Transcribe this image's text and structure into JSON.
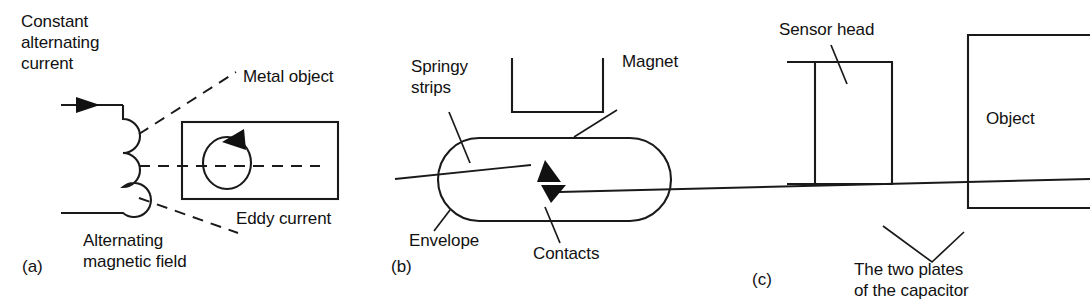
{
  "figure": {
    "background_color": "#ffffff",
    "line_color": "#1a1a1a",
    "text_color": "#111111",
    "width": 1090,
    "height": 307
  },
  "panels": [
    {
      "id": "(a)",
      "name": "eddy-current-sensor",
      "labels": {
        "source": "Constant\nalternating\ncurrent",
        "source_line1": "Constant",
        "source_line2": "alternating",
        "source_line3": "current",
        "field": "Alternating\nmagnetic field",
        "field_line1": "Alternating",
        "field_line2": "magnetic field",
        "target": "Metal object",
        "induced": "Eddy current"
      },
      "elements": [
        "current-arrow",
        "coil",
        "dashed-field-lines",
        "metal-object-rectangle",
        "eddy-current-circle"
      ]
    },
    {
      "id": "(b)",
      "name": "reed-switch-sensor",
      "labels": {
        "strips": "Springy\nstrips",
        "strips_line1": "Springy",
        "strips_line2": "strips",
        "magnet": "Magnet",
        "envelope": "Envelope",
        "contacts": "Contacts"
      },
      "elements": [
        "glass-envelope-capsule",
        "springy-strip-upper",
        "springy-strip-lower",
        "contact-upper",
        "contact-lower",
        "magnet-u-shape"
      ]
    },
    {
      "id": "(c)",
      "name": "capacitive-sensor",
      "labels": {
        "head": "Sensor head",
        "object": "Object",
        "plates": "The two plates\nof the capacitor",
        "plates_line1": "The two plates",
        "plates_line2": "of the capacitor"
      },
      "elements": [
        "sensor-head-rectangle",
        "sensor-head-plate-line",
        "object-outline",
        "capacitor-plates-leader"
      ]
    }
  ]
}
